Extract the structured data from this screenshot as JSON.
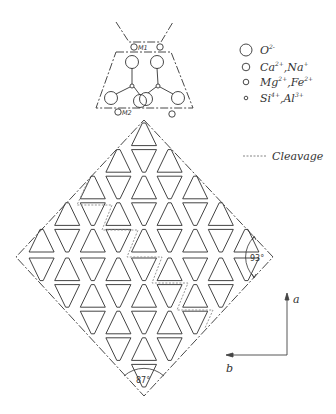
{
  "diagram": {
    "unit_cell_detail": {
      "site_labels": [
        "M1",
        "M2"
      ]
    },
    "legend": {
      "items": [
        {
          "symbol": "large-circle",
          "label": "O",
          "charge": "2-"
        },
        {
          "symbol": "medium-circle",
          "label": "Ca",
          "charge": "2+",
          "label2": "Na",
          "charge2": "+"
        },
        {
          "symbol": "small-circle",
          "label": "Mg",
          "charge": "2+",
          "label2": "Fe",
          "charge2": "2+"
        },
        {
          "symbol": "tiny-circle",
          "label": "Si",
          "charge": "4+",
          "label2": "Al",
          "charge2": "3+"
        }
      ],
      "cleavage_label": "Cleavage"
    },
    "angles": {
      "right": "93°",
      "bottom": "87°"
    },
    "axes": {
      "vertical": "a",
      "horizontal": "b"
    },
    "lattice": {
      "rows_per_half": 5,
      "counts": [
        1,
        3,
        5,
        7,
        9,
        9,
        7,
        5,
        3,
        1
      ]
    },
    "colors": {
      "line": "#2f2f2f",
      "cleavage": "#8a8a8a",
      "background": "#ffffff"
    }
  }
}
